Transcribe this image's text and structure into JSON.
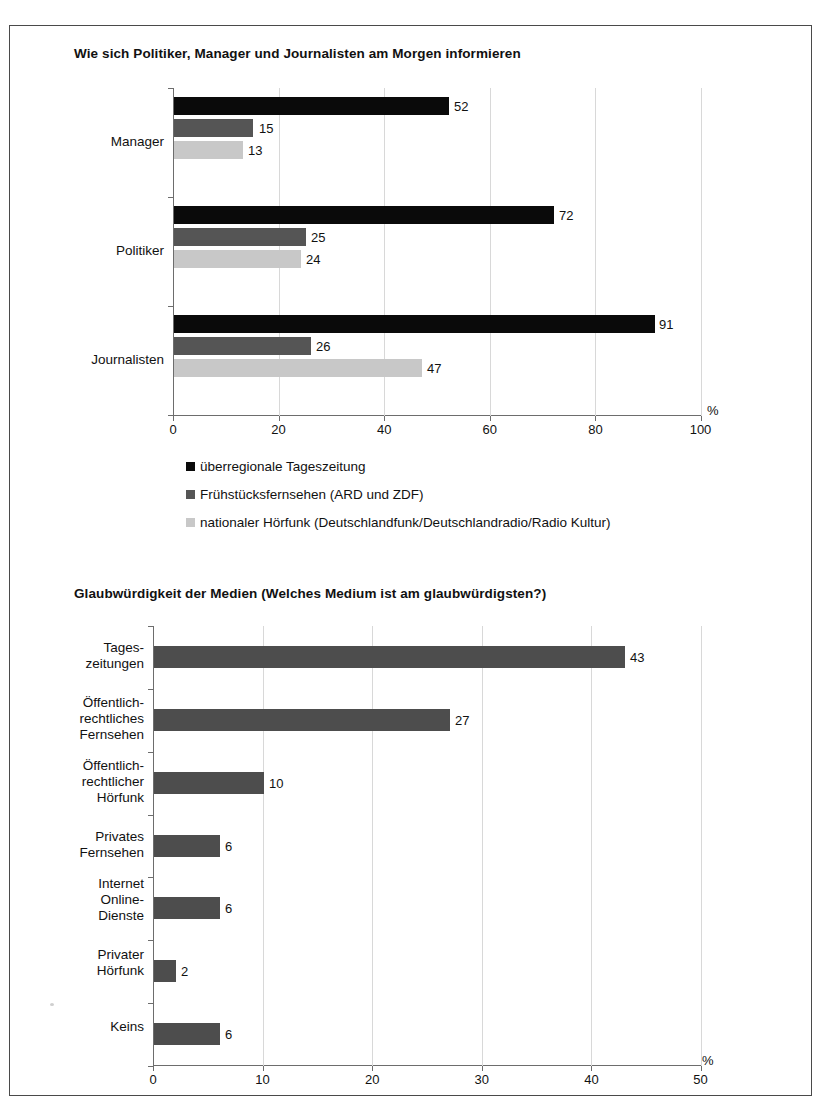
{
  "page": {
    "background": "#ffffff",
    "frame_color": "#4a4a4a"
  },
  "colors": {
    "series_1": "#0a0a0a",
    "series_2": "#555555",
    "series_3": "#c8c8c8",
    "series_single": "#4d4d4d",
    "axis": "#6d6d6d",
    "grid": "#d8d8d8"
  },
  "chart_data": [
    {
      "type": "bar",
      "orientation": "horizontal",
      "grouped": true,
      "title": "Wie sich Politiker, Manager und Journalisten am Morgen informieren",
      "xlabel": "%",
      "ylabel": "",
      "xlim": [
        0,
        100
      ],
      "xticks": [
        0,
        20,
        40,
        60,
        80,
        100
      ],
      "xticklabels": [
        "0",
        "20",
        "40",
        "60",
        "80",
        "100"
      ],
      "grid": true,
      "legend_position": "bottom",
      "categories": [
        "Manager",
        "Politiker",
        "Journalisten"
      ],
      "series": [
        {
          "name": "überregionale Tageszeitung",
          "color": "#0a0a0a",
          "values": [
            52,
            72,
            91
          ]
        },
        {
          "name": "Frühstücksfernsehen (ARD und ZDF)",
          "color": "#555555",
          "values": [
            15,
            25,
            26
          ]
        },
        {
          "name": "nationaler Hörfunk (Deutschlandfunk/Deutschlandradio/Radio Kultur)",
          "color": "#c8c8c8",
          "values": [
            13,
            24,
            47
          ]
        }
      ]
    },
    {
      "type": "bar",
      "orientation": "horizontal",
      "grouped": false,
      "title": "Glaubwürdigkeit der Medien (Welches Medium ist am glaubwürdigsten?)",
      "xlabel": "%",
      "ylabel": "",
      "xlim": [
        0,
        50
      ],
      "xticks": [
        0,
        10,
        20,
        30,
        40,
        50
      ],
      "xticklabels": [
        "0",
        "10",
        "20",
        "30",
        "40",
        "50"
      ],
      "grid": true,
      "legend_position": "none",
      "categories": [
        "Tages-\nzeitungen",
        "Öffentlich-\nrechtliches\nFernsehen",
        "Öffentlich-\nrechtlicher\nHörfunk",
        "Privates\nFernsehen",
        "Internet\nOnline-\nDienste",
        "Privater\nHörfunk",
        "Keins"
      ],
      "values": [
        43,
        27,
        10,
        6,
        6,
        2,
        6
      ],
      "bar_color": "#4d4d4d"
    }
  ]
}
